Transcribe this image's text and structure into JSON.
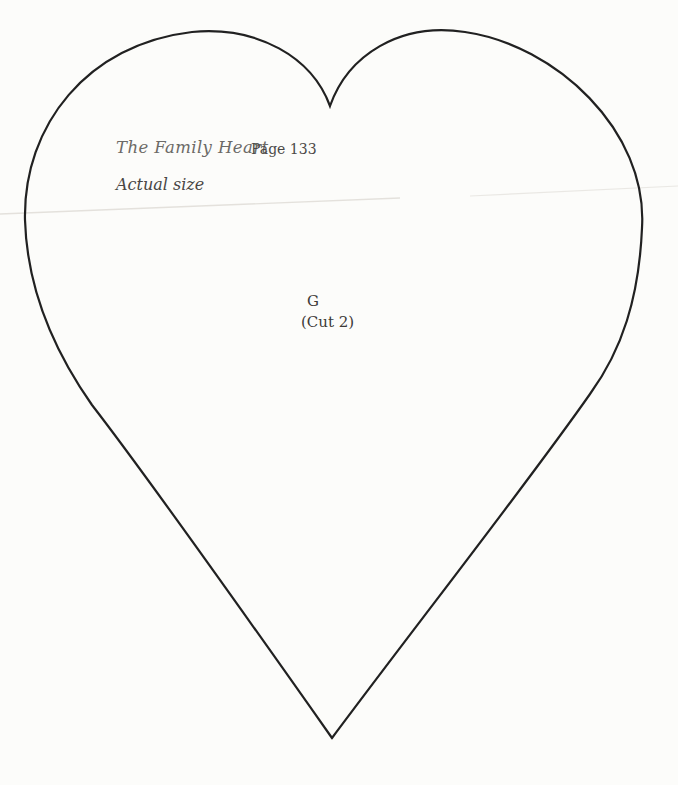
{
  "page": {
    "background_color": "#fcfcfa",
    "outline_color": "#212121",
    "crease_color": "#dcd9d3"
  },
  "header": {
    "title": "The Family Heart",
    "page_ref": "Page 133",
    "size_note": "Actual size"
  },
  "pattern": {
    "piece_label": "G",
    "cut_instruction": "(Cut 2)"
  }
}
